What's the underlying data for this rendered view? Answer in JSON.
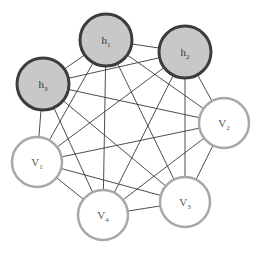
{
  "diagram": {
    "type": "graph",
    "colors": {
      "hidden_fill": "#c8c8c8",
      "hidden_stroke": "#3c3c3c",
      "visible_fill": "#ffffff",
      "visible_stroke": "#a8a8a8",
      "edge": "#3a3a3a"
    },
    "nodes": [
      {
        "id": "h1",
        "kind": "hidden",
        "label": "h",
        "sub": "1",
        "cx": 106,
        "cy": 40,
        "r": 26
      },
      {
        "id": "h2",
        "kind": "hidden",
        "label": "h",
        "sub": "2",
        "cx": 185,
        "cy": 52,
        "r": 26
      },
      {
        "id": "h3",
        "kind": "hidden",
        "label": "h",
        "sub": "3",
        "cx": 43,
        "cy": 84,
        "r": 26
      },
      {
        "id": "v2",
        "kind": "visible",
        "label": "V",
        "sub": "2",
        "cx": 224,
        "cy": 123,
        "r": 25
      },
      {
        "id": "v1",
        "kind": "visible",
        "label": "V",
        "sub": "1",
        "cx": 37,
        "cy": 162,
        "r": 25
      },
      {
        "id": "v4",
        "kind": "visible",
        "label": "V",
        "sub": "4",
        "cx": 103,
        "cy": 215,
        "r": 25
      },
      {
        "id": "v3",
        "kind": "visible",
        "label": "V",
        "sub": "3",
        "cx": 185,
        "cy": 202,
        "r": 25
      }
    ],
    "edges": [
      [
        "h1",
        "h2"
      ],
      [
        "h1",
        "h3"
      ],
      [
        "h1",
        "v1"
      ],
      [
        "h1",
        "v2"
      ],
      [
        "h1",
        "v3"
      ],
      [
        "h1",
        "v4"
      ],
      [
        "h2",
        "h3"
      ],
      [
        "h2",
        "v1"
      ],
      [
        "h2",
        "v2"
      ],
      [
        "h2",
        "v3"
      ],
      [
        "h2",
        "v4"
      ],
      [
        "h3",
        "v1"
      ],
      [
        "h3",
        "v2"
      ],
      [
        "h3",
        "v3"
      ],
      [
        "h3",
        "v4"
      ],
      [
        "v1",
        "v2"
      ],
      [
        "v1",
        "v3"
      ],
      [
        "v1",
        "v4"
      ],
      [
        "v2",
        "v3"
      ],
      [
        "v2",
        "v4"
      ],
      [
        "v3",
        "v4"
      ]
    ]
  }
}
